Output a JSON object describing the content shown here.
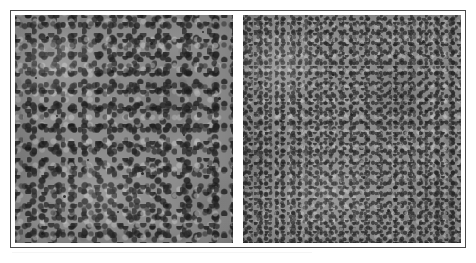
{
  "figure": {
    "type": "micrograph-comparison-figure",
    "background_color": "#ffffff",
    "frame": {
      "border_color": "#4a4a4a",
      "border_width_px": 1,
      "mat_color": "#ffffff",
      "left_px": 10,
      "top_px": 10,
      "width_px": 456,
      "height_px": 238
    },
    "divider": {
      "color": "#ffffff",
      "orientation": "vertical",
      "width_px": 6
    },
    "panel_count": 2,
    "caption": "",
    "scale_bar": "",
    "panels": [
      {
        "id": "panel-left",
        "position": "left",
        "label": "",
        "imaging_mode": "grayscale electron micrograph",
        "texture": "coarse granular",
        "grain_character": "larger agglomerated grains with pronounced dark interstitial pores",
        "base_gray": "#8d8d8d",
        "dark_feature_color": "#282828",
        "bright_feature_color": "#bebebe",
        "relative_grain_size": "coarse",
        "width_px": 218,
        "height_px": 230
      },
      {
        "id": "panel-right",
        "position": "right",
        "label": "",
        "imaging_mode": "grayscale electron micrograph",
        "texture": "fine granular",
        "grain_character": "smaller, more uniformly distributed grains with finer speckle contrast",
        "base_gray": "#8f8f8f",
        "dark_feature_color": "#303030",
        "bright_feature_color": "#c3c3c3",
        "relative_grain_size": "fine",
        "width_px": 218,
        "height_px": 230
      }
    ]
  },
  "specks": {
    "left": [
      {
        "x": "14%",
        "y": "9%",
        "d": 3
      },
      {
        "x": "37%",
        "y": "4%",
        "d": 2
      },
      {
        "x": "62%",
        "y": "12%",
        "d": 3
      },
      {
        "x": "86%",
        "y": "7%",
        "d": 2
      },
      {
        "x": "9%",
        "y": "27%",
        "d": 2
      },
      {
        "x": "44%",
        "y": "24%",
        "d": 3
      },
      {
        "x": "71%",
        "y": "31%",
        "d": 2
      },
      {
        "x": "93%",
        "y": "36%",
        "d": 3
      },
      {
        "x": "19%",
        "y": "44%",
        "d": 2
      },
      {
        "x": "52%",
        "y": "41%",
        "d": 3
      },
      {
        "x": "77%",
        "y": "52%",
        "d": 2
      },
      {
        "x": "6%",
        "y": "58%",
        "d": 3
      },
      {
        "x": "33%",
        "y": "63%",
        "d": 2
      },
      {
        "x": "58%",
        "y": "69%",
        "d": 3
      },
      {
        "x": "88%",
        "y": "66%",
        "d": 2
      },
      {
        "x": "22%",
        "y": "79%",
        "d": 3
      },
      {
        "x": "47%",
        "y": "86%",
        "d": 2
      },
      {
        "x": "69%",
        "y": "83%",
        "d": 3
      },
      {
        "x": "91%",
        "y": "93%",
        "d": 2
      },
      {
        "x": "12%",
        "y": "95%",
        "d": 3
      }
    ],
    "right": [
      {
        "x": "11%",
        "y": "7%",
        "d": 2
      },
      {
        "x": "34%",
        "y": "14%",
        "d": 2
      },
      {
        "x": "59%",
        "y": "6%",
        "d": 2
      },
      {
        "x": "82%",
        "y": "11%",
        "d": 3
      },
      {
        "x": "7%",
        "y": "29%",
        "d": 2
      },
      {
        "x": "41%",
        "y": "26%",
        "d": 2
      },
      {
        "x": "67%",
        "y": "33%",
        "d": 2
      },
      {
        "x": "95%",
        "y": "38%",
        "d": 2
      },
      {
        "x": "17%",
        "y": "46%",
        "d": 2
      },
      {
        "x": "49%",
        "y": "43%",
        "d": 3
      },
      {
        "x": "74%",
        "y": "54%",
        "d": 2
      },
      {
        "x": "4%",
        "y": "61%",
        "d": 2
      },
      {
        "x": "29%",
        "y": "66%",
        "d": 2
      },
      {
        "x": "55%",
        "y": "71%",
        "d": 2
      },
      {
        "x": "85%",
        "y": "68%",
        "d": 2
      },
      {
        "x": "20%",
        "y": "81%",
        "d": 2
      },
      {
        "x": "44%",
        "y": "88%",
        "d": 2
      },
      {
        "x": "66%",
        "y": "85%",
        "d": 3
      },
      {
        "x": "89%",
        "y": "94%",
        "d": 2
      },
      {
        "x": "10%",
        "y": "96%",
        "d": 2
      }
    ]
  }
}
